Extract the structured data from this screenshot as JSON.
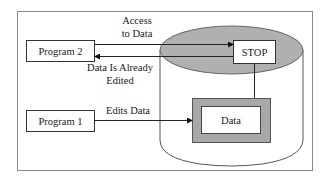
{
  "diagram": {
    "title": "",
    "nodes": {
      "program2": {
        "label": "Program 2"
      },
      "program1": {
        "label": "Program 1"
      },
      "stop": {
        "label": "STOP"
      },
      "data": {
        "label": "Data"
      },
      "database": {
        "label": ""
      }
    },
    "edges": {
      "access": {
        "label_line1": "Access",
        "label_line2": "to Data",
        "from": "Program 2",
        "to": "STOP"
      },
      "already_edited": {
        "label_line1": "Data Is Already",
        "label_line2": "Edited",
        "from": "STOP",
        "to": "Program 2"
      },
      "edits": {
        "label": "Edits Data",
        "from": "Program 1",
        "to": "Data"
      },
      "stop_to_data": {
        "from": "STOP",
        "to": "Data"
      }
    },
    "colors": {
      "cylinder_top_fill": "#b0b0b0",
      "data_frame_fill": "#a8a8a8",
      "line": "#2a2a2a",
      "frame": "#8a8a8a"
    }
  }
}
